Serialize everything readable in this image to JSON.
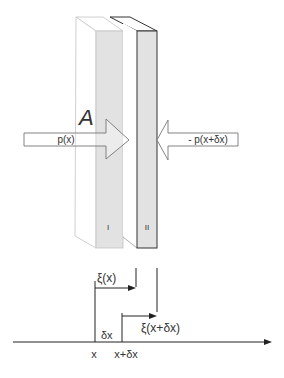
{
  "diagram": {
    "slab_area_label": "A",
    "slab_1_label": "I",
    "slab_2_label": "II",
    "left_force_label": "p(x)",
    "right_force_label": "- p(x+δx)",
    "displacement_1_label": "ξ(x)",
    "displacement_2_label": "ξ(x+δx)",
    "delta_label": "δx",
    "axis_tick_1": "x",
    "axis_tick_2": "x+δx"
  },
  "colors": {
    "slab_face": "#e2e2e2",
    "slab_1_edge": "#b8b8b8",
    "slab_2_edge": "#333333",
    "line": "#222222"
  }
}
